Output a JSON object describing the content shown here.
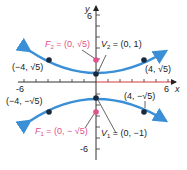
{
  "diagram": {
    "type": "hyperbola",
    "equation": "y^2 - x^2/4 = 1",
    "axes": {
      "x_label": "x",
      "y_label": "y",
      "x_ticks": {
        "min_label": "-6",
        "max_label": "6"
      },
      "y_ticks": {
        "max_label": "6",
        "min_label": "-6"
      }
    },
    "points": {
      "F2": {
        "name": "F",
        "sub": "2",
        "text": " = (0, √5)",
        "color": "#e0508c"
      },
      "V2": {
        "name": "V",
        "sub": "2",
        "text": " = (0, 1)"
      },
      "F1": {
        "name": "F",
        "sub": "1",
        "text": " = (0, − √5)",
        "color": "#e0508c"
      },
      "V1": {
        "name": "V",
        "sub": "1",
        "text": " = (0, −1)"
      },
      "p_ul": "(−4, √5)",
      "p_ur": "(4, √5)",
      "p_ll": "(−4, −√5)",
      "p_lr": "(4, −√5)"
    },
    "colors": {
      "curve": "#3a8fd6",
      "focus": "#e0508c",
      "axis_pos": "#d23b3b",
      "point": "#1a2a3a"
    }
  }
}
